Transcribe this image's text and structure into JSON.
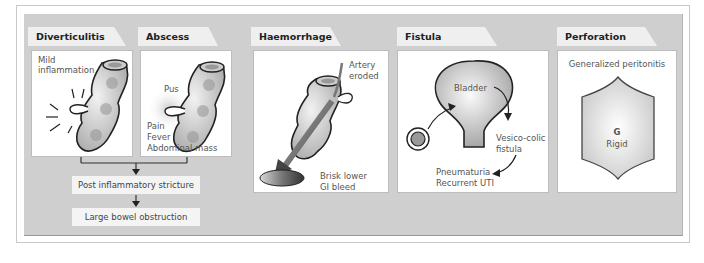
{
  "colors": {
    "panel_bg": "#cfcfcf",
    "tab_bg": "#efefef",
    "card_bg": "#ffffff",
    "flowbox_bg": "#f4f4f4",
    "text": "#555555"
  },
  "sections": [
    {
      "id": "diverticulitis",
      "title": "Diverticulitis",
      "labels": [
        "Mild",
        "inflammation"
      ]
    },
    {
      "id": "abscess",
      "title": "Abscess",
      "labels": {
        "pus": "Pus",
        "symptoms": [
          "Pain",
          "Fever",
          "Abdominal mass"
        ]
      }
    },
    {
      "id": "haemorrhage",
      "title": "Haemorrhage",
      "labels": {
        "artery": [
          "Artery",
          "eroded"
        ],
        "bleed": [
          "Brisk lower",
          "GI  bleed"
        ]
      }
    },
    {
      "id": "fistula",
      "title": "Fistula formation",
      "labels": {
        "bladder": "Bladder",
        "fistula": [
          "Vesico-colic",
          "fistula"
        ],
        "symptoms": [
          "Pneumaturia",
          "Recurrent UTI"
        ]
      }
    },
    {
      "id": "perforation",
      "title": "Perforation",
      "labels": {
        "top": "Generalized peritonitis",
        "mark": "G",
        "rigid": "Rigid"
      }
    }
  ],
  "flowchart": {
    "steps": [
      "Post inflammatory stricture",
      "Large bowel obstruction"
    ]
  },
  "icons": {
    "colon": "colon-segment-illustration",
    "bladder": "bladder-illustration",
    "abdomen": "rigid-abdomen-illustration",
    "blood_pool": "blood-pool-illustration"
  }
}
